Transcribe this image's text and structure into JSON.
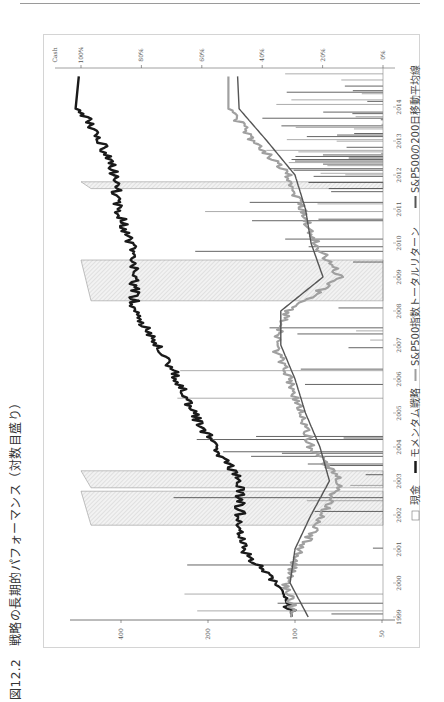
{
  "page": {
    "caption": "図12.2　戦略の長期的パフォーマンス（対数目盛り）"
  },
  "chart_data": {
    "type": "line",
    "title": "戦略の長期的パフォーマンス（対数目盛り）",
    "figure_number": "図12.2",
    "orientation": "rotated 90° counter-clockwise on the page",
    "x": [
      "1999",
      "2000",
      "2001",
      "2002",
      "2003",
      "2004",
      "2005",
      "2006",
      "2007",
      "2008",
      "2009",
      "2010",
      "2011",
      "2012",
      "2013",
      "2014"
    ],
    "xlabel": "",
    "left_axis": {
      "label": "",
      "scale": "log",
      "ticks": [
        "50",
        "100",
        "200",
        "400"
      ],
      "ylim": [
        50,
        650
      ]
    },
    "right_axis": {
      "label": "Cash",
      "scale": "linear",
      "ticks": [
        "0%",
        "20%",
        "40%",
        "60%",
        "80%",
        "100%"
      ],
      "ylim": [
        0,
        100
      ]
    },
    "grid": false,
    "legend": {
      "position": "bottom",
      "entries": [
        {
          "label": "現金",
          "style": "hatched-box",
          "color": "#bdbdbd"
        },
        {
          "label": "モメンタム戦略",
          "style": "thick-line",
          "color": "#1a1a1a"
        },
        {
          "label": "S&P500指数トータルリターン",
          "style": "line",
          "color": "#9e9e9e"
        },
        {
          "label": "S&P500の200日移動平均線",
          "style": "line",
          "color": "#555555"
        }
      ]
    },
    "series": [
      {
        "name": "モメンタム戦略",
        "axis": "left",
        "values": [
          100,
          118,
          152,
          155,
          155,
          190,
          225,
          255,
          300,
          360,
          360,
          370,
          410,
          420,
          470,
          560
        ]
      },
      {
        "name": "S&P500指数トータルリターン",
        "axis": "left",
        "values": [
          100,
          108,
          95,
          80,
          70,
          88,
          95,
          105,
          118,
          105,
          70,
          85,
          95,
          105,
          140,
          170
        ]
      },
      {
        "name": "S&P500の200日移動平均線",
        "axis": "left",
        "values": [
          90,
          104,
          100,
          88,
          76,
          82,
          92,
          100,
          112,
          112,
          80,
          88,
          92,
          100,
          125,
          158
        ]
      },
      {
        "name": "現金",
        "axis": "right",
        "unit": "%",
        "periods": [
          {
            "from": "2001.7",
            "to": "2002.7",
            "value": 100
          },
          {
            "from": "2002.8",
            "to": "2003.3",
            "value": 100
          },
          {
            "from": "2008.3",
            "to": "2009.5",
            "value": 100
          },
          {
            "from": "2011.6",
            "to": "2011.8",
            "value": 100
          }
        ],
        "note": "frequent partial-cash spikes of 0-70% throughout, dense 2012-2014"
      }
    ]
  }
}
